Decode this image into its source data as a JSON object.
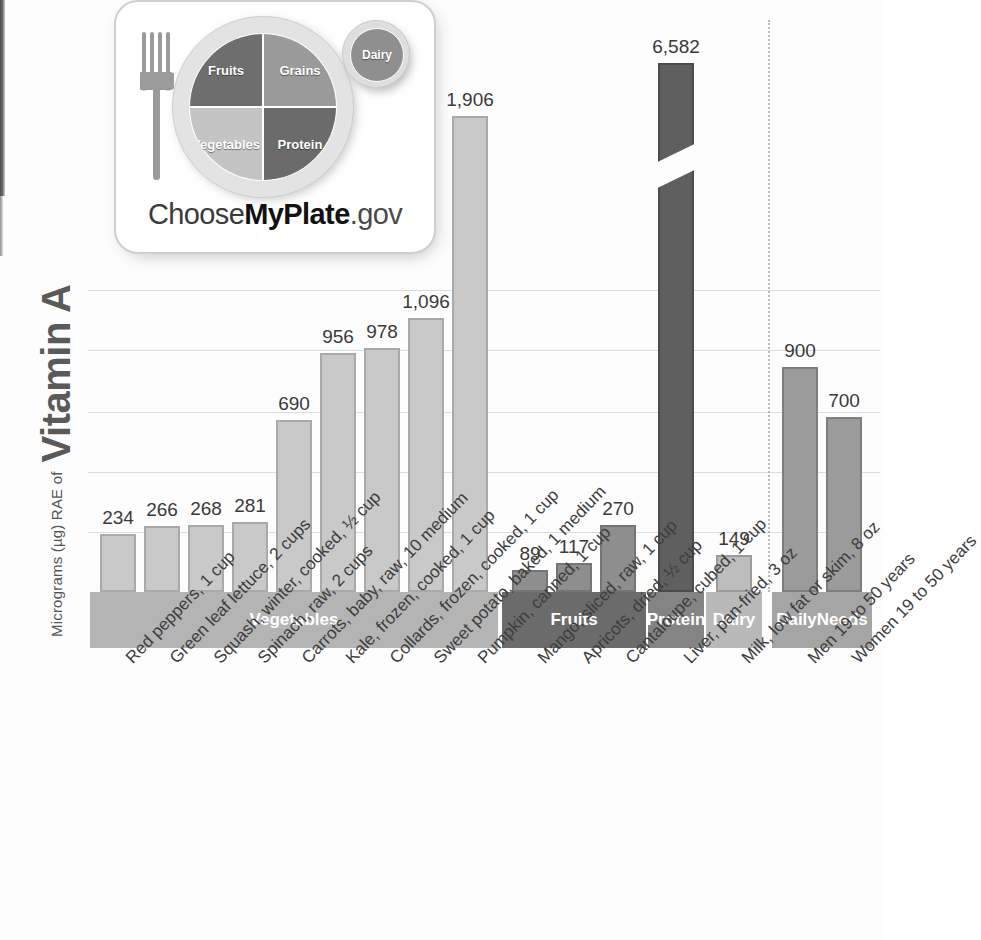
{
  "axis": {
    "y_title_small": "Micrograms (µg) RAE of",
    "y_title_big": "Vitamin A"
  },
  "logo": {
    "alt": "ChooseMyPlate.gov",
    "word_1": "Choose",
    "word_2": "MyPlate",
    "word_3": ".gov",
    "segments": {
      "fruits": "Fruits",
      "grains": "Grains",
      "vegetables": "Vegetables",
      "protein": "Protein",
      "dairy": "Dairy"
    }
  },
  "groups": [
    {
      "key": "vegetables",
      "label": "Vegetables",
      "color": "#b4b4b4"
    },
    {
      "key": "fruits",
      "label": "Fruits",
      "color": "#6b6b6b"
    },
    {
      "key": "protein",
      "label": "Protein",
      "color": "#848484"
    },
    {
      "key": "dairy",
      "label": "Dairy",
      "color": "#b9b9b9"
    },
    {
      "key": "daily_needs",
      "label": "Daily\nNeeds",
      "color": "#a5a5a5"
    }
  ],
  "chart_data": {
    "type": "bar",
    "title": "Vitamin A",
    "xlabel": "",
    "ylabel": "Micrograms (µg) RAE of Vitamin A",
    "ylim": [
      0,
      2200
    ],
    "grid": true,
    "legend": "none",
    "axis_break": {
      "bar": "Liver, pan-fried, 3 oz",
      "true_value": 6582,
      "note": "bar is truncated with a diagonal break"
    },
    "categories": [
      "Red peppers, 1 cup",
      "Green leaf lettuce, 2 cups",
      "Squash, winter, cooked, ½ cup",
      "Spinach, raw, 2 cups",
      "Carrots, baby, raw, 10 medium",
      "Kale, frozen, cooked, 1 cup",
      "Collards, frozen, cooked, 1 cup",
      "Sweet potato, baked, 1 medium",
      "Pumpkin, canned, 1 cup",
      "Mango, sliced, raw, 1 cup",
      "Apricots, dried, ½ cup",
      "Cantaloupe, cubed, 1 cup",
      "Liver, pan-fried, 3 oz",
      "Milk, low fat or skim, 8 oz",
      "Men 19 to 50 years",
      "Women 19 to 50 years"
    ],
    "values": [
      234,
      266,
      268,
      281,
      690,
      956,
      978,
      1096,
      1906,
      89,
      117,
      270,
      6582,
      149,
      900,
      700
    ],
    "value_labels": [
      "234",
      "266",
      "268",
      "281",
      "690",
      "956",
      "978",
      "1,096",
      "1,906",
      "89",
      "117",
      "270",
      "6,582",
      "149",
      "900",
      "700"
    ],
    "group_of": [
      "vegetables",
      "vegetables",
      "vegetables",
      "vegetables",
      "vegetables",
      "vegetables",
      "vegetables",
      "vegetables",
      "vegetables",
      "fruits",
      "fruits",
      "fruits",
      "protein",
      "dairy",
      "daily_needs",
      "daily_needs"
    ]
  }
}
